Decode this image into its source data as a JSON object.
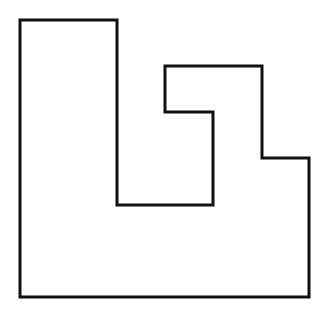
{
  "diagram": {
    "type": "rectilinear-polygon-outline",
    "vertex_count": 12,
    "colors": {
      "background": "#ffffff",
      "stroke": "#111111",
      "fill": "#ffffff"
    }
  }
}
